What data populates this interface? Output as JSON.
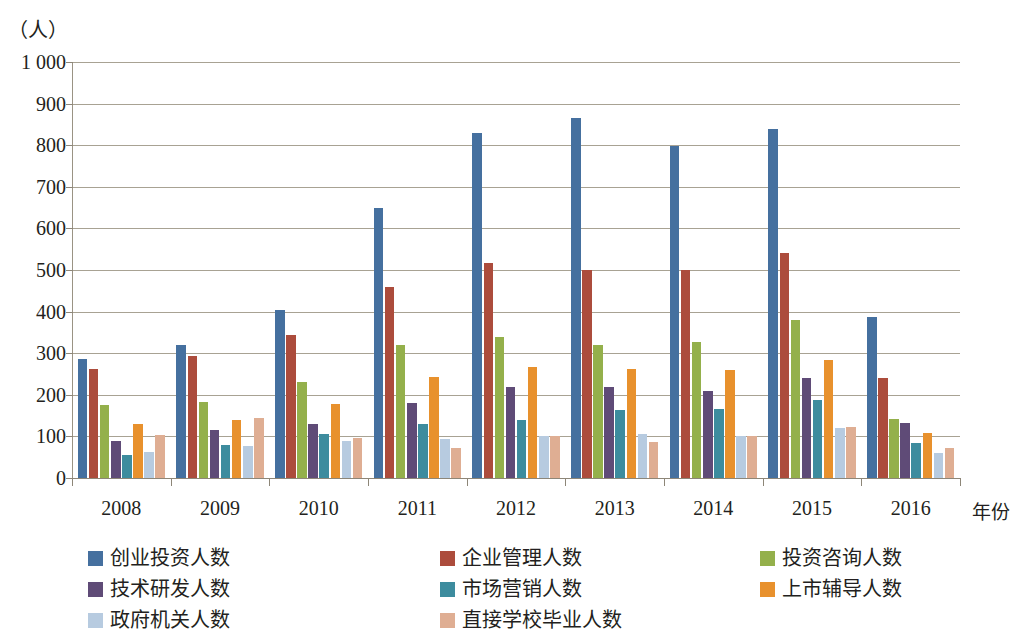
{
  "chart_data": {
    "type": "bar",
    "title": "",
    "subtitle": "",
    "xlabel": "年份",
    "ylabel": "（人）",
    "ylim": [
      0,
      1000
    ],
    "ytick_step": 100,
    "ytick_labels": [
      "0",
      "100",
      "200",
      "300",
      "400",
      "500",
      "600",
      "700",
      "800",
      "900",
      "1 000"
    ],
    "grid": "horizontal",
    "legend_position": "bottom",
    "categories": [
      "2008",
      "2009",
      "2010",
      "2011",
      "2012",
      "2013",
      "2014",
      "2015",
      "2016"
    ],
    "series": [
      {
        "name": "创业投资人数",
        "color": "#45709F",
        "values": [
          285,
          320,
          405,
          650,
          830,
          865,
          798,
          838,
          388
        ]
      },
      {
        "name": "企业管理人数",
        "color": "#AC4C3C",
        "values": [
          262,
          293,
          343,
          458,
          517,
          500,
          500,
          542,
          240
        ]
      },
      {
        "name": "投资咨询人数",
        "color": "#94B04B",
        "values": [
          175,
          183,
          232,
          320,
          340,
          320,
          328,
          380,
          142
        ]
      },
      {
        "name": "技术研发人数",
        "color": "#5F4B77",
        "values": [
          90,
          115,
          130,
          180,
          218,
          218,
          210,
          240,
          132
        ]
      },
      {
        "name": "市场营销人数",
        "color": "#3D8C9E",
        "values": [
          55,
          80,
          105,
          130,
          140,
          163,
          165,
          188,
          85
        ]
      },
      {
        "name": "上市辅导人数",
        "color": "#E8912D",
        "values": [
          130,
          140,
          177,
          243,
          268,
          263,
          260,
          283,
          108
        ]
      },
      {
        "name": "政府机关人数",
        "color": "#B7CBE0",
        "values": [
          62,
          78,
          90,
          93,
          100,
          105,
          100,
          120,
          60
        ]
      },
      {
        "name": "直接学校毕业人数",
        "color": "#DFAE93",
        "values": [
          103,
          145,
          95,
          72,
          100,
          87,
          100,
          122,
          73
        ]
      }
    ]
  },
  "axes": {
    "y_unit_caption": "（人）",
    "x_axis_title": "年份"
  }
}
